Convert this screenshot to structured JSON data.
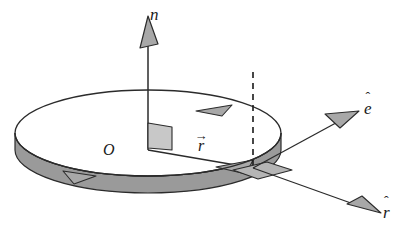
{
  "figure": {
    "background_color": "#ffffff",
    "width": 410,
    "height": 236
  },
  "labels": {
    "normal_vector": {
      "symbol": "n",
      "accent": "ˆ",
      "name": "n-hat"
    },
    "tangential_vector": {
      "symbol": "e",
      "accent": "ˆ",
      "name": "e-hat"
    },
    "radial_vector": {
      "symbol": "r",
      "accent": "ˆ",
      "name": "r-hat"
    },
    "position_vector": {
      "symbol": "r",
      "accent": "→",
      "name": "r-vector"
    },
    "origin": {
      "symbol": "O",
      "accent": "",
      "name": "origin"
    }
  },
  "colors": {
    "stroke": "#2b2b2b",
    "disk_top_fill": "#ffffff",
    "disk_edge_fill": "#9a9a9a",
    "arrowhead_fill": "#a8a8a8",
    "patch_fill": "#b5b5b5",
    "right_angle_fill": "#c8c8c8",
    "dashed_line": "#1a1a1a"
  },
  "geometry": {
    "disk_center": {
      "x": 148,
      "y": 133
    },
    "disk_rx": 133,
    "disk_ry": 43,
    "disk_thickness": 17,
    "normal_tip": {
      "x": 148,
      "y": 18
    },
    "e_tip": {
      "x": 357,
      "y": 113
    },
    "r_tip": {
      "x": 379,
      "y": 213
    },
    "patch_point": {
      "x": 253,
      "y": 168
    },
    "dashed_top": {
      "x": 253,
      "y": 73
    },
    "dashed_bottom": {
      "x": 253,
      "y": 174
    }
  },
  "elements": {
    "disk_surface": "elliptical-disk-top",
    "disk_rim": "disk-side-wall",
    "right_angle_marker": "perpendicularity-square",
    "surface_patch": "rim-area-element",
    "dashed_reference": "vertical-dashed-line",
    "rotation_arrows": [
      "rim-arrow-top",
      "rim-arrow-bottom-left",
      "rim-arrow-inner"
    ]
  }
}
